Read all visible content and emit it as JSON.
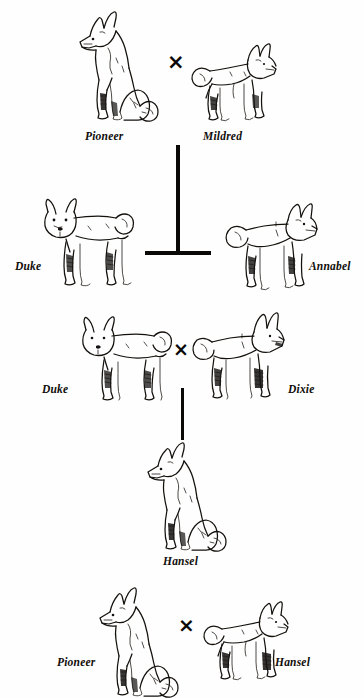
{
  "diagram": {
    "type": "pedigree-cross-diagram",
    "background_color": "#fefefe",
    "ink_color": "#14110d",
    "cross_symbol": "×",
    "generations": [
      {
        "id": "generation-1",
        "label": "Pioneer × Mildred",
        "parents": [
          {
            "name": "Pioneer",
            "pose": "sitting",
            "facing": "left"
          },
          {
            "name": "Mildred",
            "pose": "standing",
            "facing": "right"
          }
        ],
        "connector": "t-bar"
      },
      {
        "id": "generation-2",
        "label": "Duke and Annabel",
        "offspring": [
          {
            "name": "Duke",
            "pose": "standing",
            "facing": "left"
          },
          {
            "name": "Annabel",
            "pose": "standing",
            "facing": "right"
          }
        ]
      },
      {
        "id": "generation-3",
        "label": "Duke × Dixie",
        "parents": [
          {
            "name": "Duke",
            "pose": "standing",
            "facing": "left"
          },
          {
            "name": "Dixie",
            "pose": "standing",
            "facing": "right"
          }
        ],
        "connector": "vertical-line"
      },
      {
        "id": "generation-4",
        "label": "Hansel",
        "offspring": [
          {
            "name": "Hansel",
            "pose": "sitting",
            "facing": "left"
          }
        ]
      },
      {
        "id": "generation-5",
        "label": "Pioneer × Hansel",
        "parents": [
          {
            "name": "Pioneer",
            "pose": "sitting",
            "facing": "left"
          },
          {
            "name": "Hansel",
            "pose": "standing",
            "facing": "right"
          }
        ]
      }
    ]
  },
  "labels": {
    "pioneer_top": "Pioneer",
    "mildred": "Mildred",
    "duke_left": "Duke",
    "annabel": "Annabel",
    "duke_row3": "Duke",
    "dixie": "Dixie",
    "hansel_center": "Hansel",
    "pioneer_bottom": "Pioneer",
    "hansel_bottom": "Hansel"
  },
  "cross_marks": {
    "top": "×",
    "middle": "×",
    "bottom": "×"
  }
}
